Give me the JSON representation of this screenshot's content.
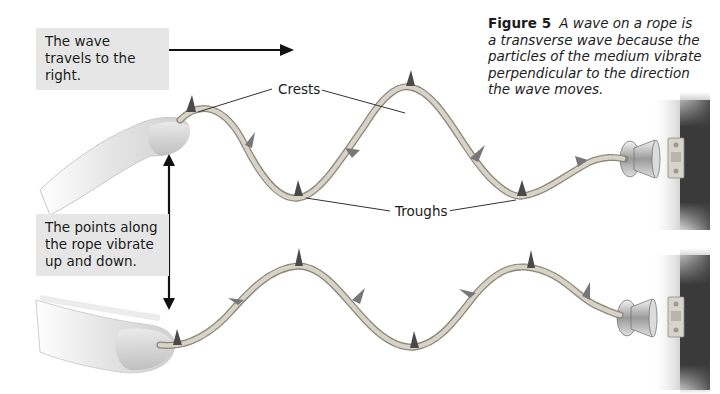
{
  "figure": {
    "number_label": "Figure 5",
    "caption": "A wave on a rope is a transverse wave because the particles of the medium vibrate perpendicular to the direction the wave moves."
  },
  "callouts": {
    "travel_direction": "The wave travels to the right.",
    "vibration": "The points along the rope vibrate up and down.",
    "crests": "Crests",
    "troughs": "Troughs"
  },
  "illustration": {
    "panels": [
      {
        "name": "top-wave",
        "description": "Hand shaking rope attached to wall hook; wave starts at crest near hand"
      },
      {
        "name": "bottom-wave",
        "description": "Same rope later; wave shifted to the right, starts at trough near hand"
      }
    ],
    "arrows": [
      "arrow-right-travel",
      "double-arrow-vertical-vibration"
    ]
  },
  "colors": {
    "label_box_bg": "#e6e6e6",
    "rope": "#c9c4b8",
    "rope_shadow": "#8d877b",
    "marker": "#4a4a4a",
    "wall": "#3a3a3a",
    "text": "#1c1c1c"
  }
}
